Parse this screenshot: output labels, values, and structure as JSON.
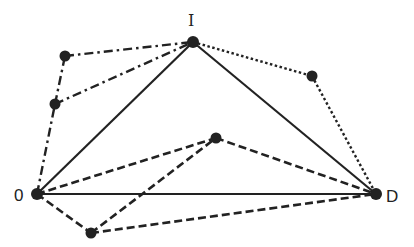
{
  "diagram": {
    "type": "network-graph",
    "colors": {
      "ink": "#222222",
      "background": "#ffffff"
    },
    "nodes": [
      {
        "id": "O",
        "label": "0",
        "labeled": true
      },
      {
        "id": "I",
        "label": "I",
        "labeled": true
      },
      {
        "id": "D",
        "label": "D",
        "labeled": true
      },
      {
        "id": "P1",
        "label": "",
        "labeled": false
      },
      {
        "id": "P2",
        "label": "",
        "labeled": false
      },
      {
        "id": "P3",
        "label": "",
        "labeled": false
      },
      {
        "id": "P4",
        "label": "",
        "labeled": false
      },
      {
        "id": "P5",
        "label": "",
        "labeled": false
      }
    ],
    "edges": [
      {
        "from": "O",
        "to": "I",
        "style": "solid"
      },
      {
        "from": "I",
        "to": "D",
        "style": "solid"
      },
      {
        "from": "O",
        "to": "D",
        "style": "solid"
      },
      {
        "from": "O",
        "to": "P2",
        "style": "dash-dot"
      },
      {
        "from": "P2",
        "to": "P1",
        "style": "dash-dot"
      },
      {
        "from": "P1",
        "to": "I",
        "style": "dash-dot"
      },
      {
        "from": "P2",
        "to": "I",
        "style": "dash-dot"
      },
      {
        "from": "I",
        "to": "P3",
        "style": "dotted"
      },
      {
        "from": "P3",
        "to": "D",
        "style": "dotted"
      },
      {
        "from": "O",
        "to": "P4",
        "style": "dashed"
      },
      {
        "from": "P4",
        "to": "D",
        "style": "dashed"
      },
      {
        "from": "O",
        "to": "P5",
        "style": "dashed"
      },
      {
        "from": "P5",
        "to": "P4",
        "style": "dashed"
      },
      {
        "from": "P5",
        "to": "D",
        "style": "dashed"
      }
    ]
  }
}
